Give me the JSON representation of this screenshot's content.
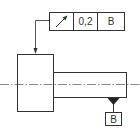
{
  "diagram": {
    "type": "gdt-runout",
    "feature_control_frame": {
      "symbol": "circular-runout-arrow",
      "tolerance": "0,2",
      "datum": "B"
    },
    "datum_feature": {
      "label": "B"
    },
    "colors": {
      "line": "#333333",
      "centerline": "#888888",
      "background": "#ffffff"
    }
  }
}
